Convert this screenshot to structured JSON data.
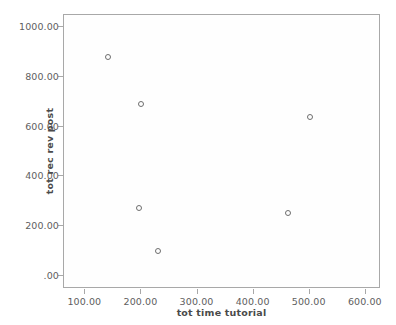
{
  "chart_data": {
    "type": "scatter",
    "title": "",
    "xlabel": "tot time tutorial",
    "ylabel": "tot rec rev post",
    "xlim": [
      62,
      627
    ],
    "ylim": [
      -52,
      1048
    ],
    "grid": false,
    "legend": "none",
    "marker": "open-circle",
    "x_ticks": [
      100,
      200,
      300,
      400,
      500,
      600
    ],
    "x_tick_labels": [
      "100.00",
      "200.00",
      "300.00",
      "400.00",
      "500.00",
      "600.00"
    ],
    "y_ticks": [
      1000,
      800,
      600,
      400,
      200,
      0
    ],
    "y_tick_labels": [
      "1000.00",
      "800.00",
      "600.00",
      "400.00",
      "200.00",
      ".00"
    ],
    "points": [
      {
        "x": 140,
        "y": 880
      },
      {
        "x": 200,
        "y": 690
      },
      {
        "x": 500,
        "y": 638
      },
      {
        "x": 196,
        "y": 272
      },
      {
        "x": 462,
        "y": 252
      },
      {
        "x": 230,
        "y": 100
      }
    ],
    "colors": {
      "marker_stroke": "#6e6e6e",
      "frame": "#a8a8a8",
      "tick_label": "#5e5e5e",
      "axis_title": "#4a4a4a",
      "plot_background": "#fefefe",
      "page_background": "#ffffff"
    }
  }
}
